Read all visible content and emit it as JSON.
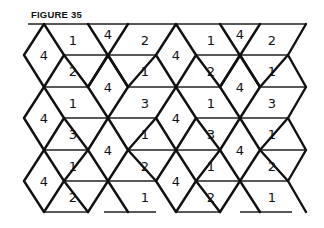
{
  "figure": {
    "title": "FIGURE 35",
    "ink_color": "#111111",
    "background": "#ffffff"
  },
  "geometry": {
    "rows_y": [
      24,
      55,
      87,
      118,
      150,
      181,
      212
    ],
    "diamond_half_width": 20
  },
  "cells": [
    {
      "shape": "diamond",
      "label": "4",
      "x": 44,
      "y": 55
    },
    {
      "shape": "diamond",
      "label": "4",
      "x": 44,
      "y": 118
    },
    {
      "shape": "diamond",
      "label": "4",
      "x": 44,
      "y": 181
    },
    {
      "shape": "diamond",
      "label": "4",
      "x": 108,
      "y": 87
    },
    {
      "shape": "diamond",
      "label": "4",
      "x": 108,
      "y": 150
    },
    {
      "shape": "triangle",
      "label": "4",
      "x": 108,
      "y": 34
    },
    {
      "shape": "diamond",
      "label": "4",
      "x": 176,
      "y": 55
    },
    {
      "shape": "diamond",
      "label": "4",
      "x": 176,
      "y": 118
    },
    {
      "shape": "diamond",
      "label": "4",
      "x": 176,
      "y": 181
    },
    {
      "shape": "diamond",
      "label": "4",
      "x": 240,
      "y": 87
    },
    {
      "shape": "diamond",
      "label": "4",
      "x": 240,
      "y": 150
    },
    {
      "shape": "triangle",
      "label": "4",
      "x": 240,
      "y": 34
    },
    {
      "shape": "parallelogram",
      "label": "1",
      "x": 73,
      "y": 40
    },
    {
      "shape": "parallelogram",
      "label": "2",
      "x": 73,
      "y": 71
    },
    {
      "shape": "parallelogram",
      "label": "1",
      "x": 73,
      "y": 103
    },
    {
      "shape": "parallelogram",
      "label": "3",
      "x": 73,
      "y": 134
    },
    {
      "shape": "parallelogram",
      "label": "1",
      "x": 73,
      "y": 166
    },
    {
      "shape": "parallelogram",
      "label": "2",
      "x": 73,
      "y": 197
    },
    {
      "shape": "parallelogram",
      "label": "2",
      "x": 145,
      "y": 40
    },
    {
      "shape": "parallelogram",
      "label": "1",
      "x": 145,
      "y": 71
    },
    {
      "shape": "parallelogram",
      "label": "3",
      "x": 145,
      "y": 103
    },
    {
      "shape": "parallelogram",
      "label": "1",
      "x": 145,
      "y": 134
    },
    {
      "shape": "parallelogram",
      "label": "2",
      "x": 145,
      "y": 166
    },
    {
      "shape": "parallelogram",
      "label": "1",
      "x": 145,
      "y": 197
    },
    {
      "shape": "parallelogram",
      "label": "1",
      "x": 211,
      "y": 40
    },
    {
      "shape": "parallelogram",
      "label": "2",
      "x": 211,
      "y": 71
    },
    {
      "shape": "parallelogram",
      "label": "1",
      "x": 211,
      "y": 103
    },
    {
      "shape": "parallelogram",
      "label": "3",
      "x": 211,
      "y": 134
    },
    {
      "shape": "parallelogram",
      "label": "1",
      "x": 211,
      "y": 166
    },
    {
      "shape": "parallelogram",
      "label": "2",
      "x": 211,
      "y": 197
    },
    {
      "shape": "parallelogram",
      "label": "2",
      "x": 272,
      "y": 40
    },
    {
      "shape": "parallelogram",
      "label": "1",
      "x": 272,
      "y": 71
    },
    {
      "shape": "parallelogram",
      "label": "3",
      "x": 272,
      "y": 103
    },
    {
      "shape": "parallelogram",
      "label": "1",
      "x": 272,
      "y": 134
    },
    {
      "shape": "parallelogram",
      "label": "2",
      "x": 272,
      "y": 166
    },
    {
      "shape": "parallelogram",
      "label": "1",
      "x": 272,
      "y": 197
    }
  ]
}
